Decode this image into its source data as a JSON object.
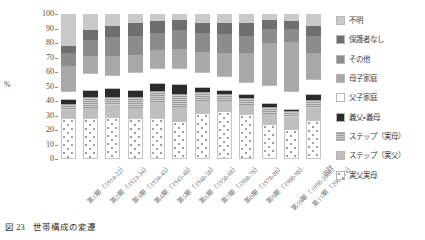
{
  "caption": {
    "number": "図 23",
    "title": "世帯構成の変遷"
  },
  "chart_data": {
    "type": "bar",
    "stacked": true,
    "normalized": true,
    "title": "世帯構成の変遷",
    "xlabel": "",
    "ylabel": "%",
    "ylim": [
      0,
      100
    ],
    "ytick_values": [
      0,
      10,
      20,
      30,
      40,
      50,
      60,
      70,
      80,
      90,
      100
    ],
    "ytick_labels": [
      "0",
      "10",
      "20",
      "30",
      "40",
      "50",
      "60",
      "70",
      "80",
      "90",
      "100"
    ],
    "grid": false,
    "legend_position": "right",
    "categories": [
      "第1期（1914-22）",
      "第2期（1923-34）",
      "第3期（1934-45）",
      "第4期（1945-48）",
      "第5期（1948-58）",
      "第6期（1958-68）",
      "第7期（1968-78）",
      "第8期（1978-88）",
      "第9期（1988-98）",
      "第10期（1998-2008）",
      "第11期（2008-14）",
      "合計"
    ],
    "series": [
      {
        "name": "実父実母",
        "fill": "f-jitsu",
        "color": "#ffffff",
        "values": [
          28,
          28,
          29,
          28,
          28,
          26,
          32,
          33,
          31,
          24,
          21,
          27
        ]
      },
      {
        "name": "ステップ（実父）",
        "fill": "f-step-chichi",
        "color": "#bfbfbf",
        "values": [
          6,
          7,
          8,
          7,
          11,
          10,
          8,
          7,
          6,
          7,
          8,
          8
        ]
      },
      {
        "name": "ステップ（実母）",
        "fill": "f-step-haha",
        "color": "#b4b4b4",
        "values": [
          4,
          8,
          6,
          8,
          8,
          9,
          6,
          5,
          5,
          5,
          4,
          6
        ]
      },
      {
        "name": "義父・義母",
        "fill": "f-gifu",
        "color": "#2b2b2b",
        "values": [
          3,
          4,
          5,
          4,
          5,
          6,
          3,
          2,
          2,
          2,
          1,
          3
        ]
      },
      {
        "name": "父子家庭",
        "fill": "f-foshi",
        "color": "#ffffff",
        "values": [
          6,
          12,
          10,
          13,
          11,
          12,
          11,
          10,
          9,
          13,
          13,
          11
        ]
      },
      {
        "name": "母子家庭",
        "fill": "f-boshi",
        "color": "#a8a8a8",
        "values": [
          17,
          12,
          13,
          12,
          12,
          13,
          14,
          16,
          20,
          29,
          34,
          18
        ]
      },
      {
        "name": "その他",
        "fill": "f-sonota",
        "color": "#8c8c8c",
        "values": [
          9,
          11,
          13,
          13,
          12,
          13,
          13,
          13,
          12,
          10,
          9,
          12
        ]
      },
      {
        "name": "保護者なし",
        "fill": "f-hogosha",
        "color": "#6f6f6f",
        "values": [
          5,
          7,
          8,
          9,
          8,
          7,
          7,
          8,
          9,
          6,
          5,
          7
        ]
      },
      {
        "name": "不明",
        "fill": "f-fumei",
        "color": "#c9c9c9",
        "values": [
          22,
          11,
          8,
          6,
          5,
          4,
          6,
          6,
          6,
          4,
          5,
          8
        ]
      }
    ],
    "legend_entries": [
      {
        "label": "不明",
        "fill": "f-fumei",
        "color": "#c9c9c9"
      },
      {
        "label": "保護者なし",
        "fill": "f-hogosha",
        "color": "#6f6f6f"
      },
      {
        "label": "その他",
        "fill": "f-sonota",
        "color": "#8c8c8c"
      },
      {
        "label": "母子家庭",
        "fill": "f-boshi",
        "color": "#a8a8a8"
      },
      {
        "label": "父子家庭",
        "fill": "f-foshi",
        "color": "#ffffff"
      },
      {
        "label": "義父・義母",
        "fill": "f-gifu",
        "color": "#2b2b2b"
      },
      {
        "label": "ステップ（実母）",
        "fill": "f-step-haha",
        "color": "#b4b4b4"
      },
      {
        "label": "ステップ（実父）",
        "fill": "f-step-chichi",
        "color": "#bfbfbf"
      },
      {
        "label": "実父実母",
        "fill": "f-jitsu",
        "color": "#ffffff"
      }
    ]
  }
}
